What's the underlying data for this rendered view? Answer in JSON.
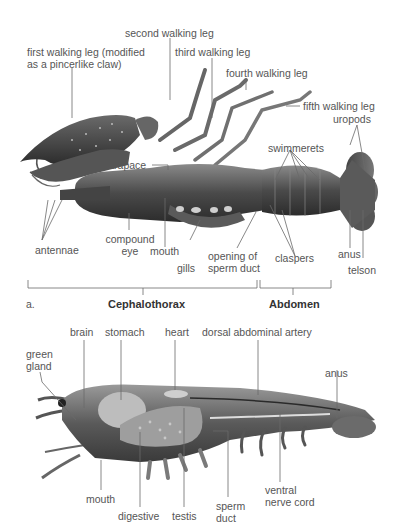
{
  "figure_a": {
    "panel_label": "a.",
    "labels": {
      "second_walking_leg": "second walking leg",
      "first_walking_leg_line1": "first walking leg (modified",
      "first_walking_leg_line2": "as a pincerlike claw)",
      "third_walking_leg": "third walking leg",
      "fourth_walking_leg": "fourth walking leg",
      "fifth_walking_leg": "fifth walking leg",
      "uropods": "uropods",
      "swimmerets": "swimmerets",
      "carapace": "carapace",
      "antennae": "antennae",
      "compound_eye_line1": "compound",
      "compound_eye_line2": "eye",
      "mouth": "mouth",
      "gills": "gills",
      "opening_line1": "opening of",
      "opening_line2": "sperm duct",
      "claspers": "claspers",
      "anus": "anus",
      "telson": "telson"
    },
    "regions": {
      "cephalothorax": "Cephalothorax",
      "abdomen": "Abdomen"
    }
  },
  "figure_b": {
    "labels": {
      "brain": "brain",
      "stomach": "stomach",
      "heart": "heart",
      "dorsal_abdominal_artery": "dorsal abdominal artery",
      "green_gland_line1": "green",
      "green_gland_line2": "gland",
      "anus": "anus",
      "mouth": "mouth",
      "digestive": "digestive",
      "testis": "testis",
      "sperm_line1": "sperm",
      "sperm_line2": "duct",
      "ventral_line1": "ventral",
      "ventral_line2": "nerve cord"
    }
  },
  "colors": {
    "line": "#6a6a6a",
    "body_dark": "#3a3a3a",
    "body_mid": "#6e6e6e",
    "body_light": "#a8a8a8",
    "text": "#555555"
  }
}
